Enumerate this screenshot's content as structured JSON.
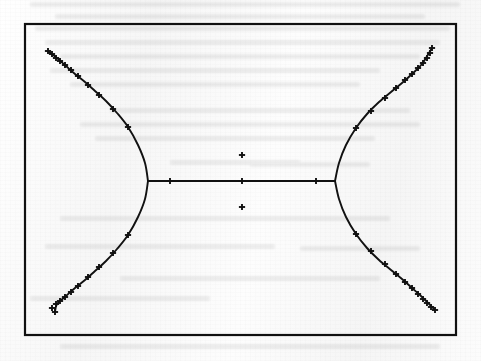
{
  "document": {
    "kind": "scanned-figure",
    "page_background": "#fbfbfb",
    "ink_color": "#111111"
  },
  "figure": {
    "name": "bowtie-curve-plot",
    "caption": "",
    "frame": {
      "x": 25,
      "y": 24,
      "width": 431,
      "height": 311,
      "stroke": "#111111",
      "stroke_width": 2.2
    },
    "axes_visible": false,
    "gridlines_visible": false,
    "tick_labels_visible": false,
    "marker_symbol": "+",
    "marker_name": "plus-marker"
  },
  "chart_data": {
    "type": "line",
    "title": "",
    "subtitle": "",
    "xlabel": "",
    "ylabel": "",
    "xlim": [
      25,
      456
    ],
    "ylim": [
      24,
      335
    ],
    "grid": false,
    "legend": null,
    "legend_position": "none",
    "axis_ticks": false,
    "marker": "+",
    "series": [
      {
        "name": "upper-left-branch",
        "path": [
          [
            48,
            51
          ],
          [
            57,
            58
          ],
          [
            66,
            66
          ],
          [
            75,
            74
          ],
          [
            85,
            82
          ],
          [
            95,
            91
          ],
          [
            106,
            101
          ],
          [
            117,
            113
          ],
          [
            128,
            127
          ],
          [
            138,
            145
          ],
          [
            145,
            163
          ],
          [
            148,
            181
          ]
        ],
        "markers": [
          [
            48,
            51
          ],
          [
            52,
            54
          ],
          [
            56,
            58
          ],
          [
            60,
            61
          ],
          [
            65,
            65
          ],
          [
            71,
            70
          ],
          [
            78,
            76
          ],
          [
            88,
            85
          ],
          [
            99,
            95
          ],
          [
            113,
            109
          ],
          [
            128,
            127
          ]
        ]
      },
      {
        "name": "lower-left-branch",
        "path": [
          [
            148,
            181
          ],
          [
            145,
            199
          ],
          [
            138,
            217
          ],
          [
            128,
            235
          ],
          [
            117,
            249
          ],
          [
            106,
            261
          ],
          [
            95,
            271
          ],
          [
            85,
            280
          ],
          [
            75,
            288
          ],
          [
            66,
            296
          ],
          [
            57,
            304
          ],
          [
            55,
            312
          ]
        ],
        "markers": [
          [
            128,
            235
          ],
          [
            113,
            253
          ],
          [
            99,
            267
          ],
          [
            88,
            277
          ],
          [
            78,
            286
          ],
          [
            71,
            292
          ],
          [
            65,
            297
          ],
          [
            60,
            301
          ],
          [
            56,
            304
          ],
          [
            52,
            308
          ],
          [
            55,
            312
          ]
        ]
      },
      {
        "name": "upper-right-branch",
        "path": [
          [
            335,
            181
          ],
          [
            339,
            163
          ],
          [
            346,
            145
          ],
          [
            356,
            128
          ],
          [
            367,
            114
          ],
          [
            379,
            102
          ],
          [
            391,
            92
          ],
          [
            402,
            83
          ],
          [
            412,
            74
          ],
          [
            422,
            64
          ],
          [
            432,
            48
          ]
        ],
        "markers": [
          [
            356,
            128
          ],
          [
            371,
            111
          ],
          [
            385,
            98
          ],
          [
            396,
            88
          ],
          [
            405,
            80
          ],
          [
            412,
            74
          ],
          [
            418,
            68
          ],
          [
            423,
            63
          ],
          [
            427,
            58
          ],
          [
            430,
            53
          ],
          [
            432,
            48
          ]
        ]
      },
      {
        "name": "lower-right-branch",
        "path": [
          [
            335,
            181
          ],
          [
            339,
            199
          ],
          [
            346,
            217
          ],
          [
            356,
            234
          ],
          [
            367,
            248
          ],
          [
            379,
            260
          ],
          [
            391,
            270
          ],
          [
            402,
            279
          ],
          [
            412,
            288
          ],
          [
            422,
            297
          ],
          [
            435,
            310
          ]
        ],
        "markers": [
          [
            356,
            234
          ],
          [
            371,
            251
          ],
          [
            385,
            264
          ],
          [
            396,
            274
          ],
          [
            405,
            282
          ],
          [
            412,
            288
          ],
          [
            418,
            294
          ],
          [
            423,
            299
          ],
          [
            427,
            303
          ],
          [
            431,
            307
          ],
          [
            435,
            310
          ]
        ]
      },
      {
        "name": "central-horizontal-segment",
        "path": [
          [
            148,
            181
          ],
          [
            335,
            181
          ]
        ],
        "markers": [
          [
            170,
            181
          ],
          [
            242,
            181
          ],
          [
            316,
            181
          ]
        ]
      }
    ],
    "isolated_points": {
      "name": "off-curve-plus-markers",
      "values": [
        [
          242,
          155
        ],
        [
          242,
          207
        ]
      ]
    }
  }
}
